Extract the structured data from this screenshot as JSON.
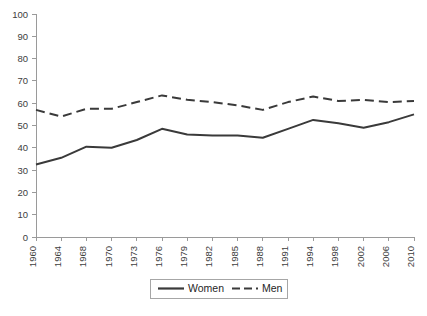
{
  "chart_data": {
    "type": "line",
    "title": "",
    "xlabel": "",
    "ylabel": "",
    "ylim": [
      0,
      100
    ],
    "ytick_step": 10,
    "yticks": [
      0,
      10,
      20,
      30,
      40,
      50,
      60,
      70,
      80,
      90,
      100
    ],
    "grid": false,
    "legend_position": "bottom-center",
    "categories": [
      "1960",
      "1964",
      "1968",
      "1970",
      "1973",
      "1976",
      "1979",
      "1982",
      "1985",
      "1988",
      "1991",
      "1994",
      "1998",
      "2002",
      "2006",
      "2010"
    ],
    "series": [
      {
        "name": "Women",
        "style": "solid",
        "color": "#3a3a3a",
        "values": [
          32.5,
          35.5,
          40.5,
          40.0,
          43.5,
          48.5,
          46.0,
          45.5,
          45.5,
          44.5,
          48.5,
          52.5,
          51.0,
          49.0,
          51.5,
          55.0
        ]
      },
      {
        "name": "Men",
        "style": "dashed",
        "color": "#3a3a3a",
        "values": [
          57.0,
          54.0,
          57.5,
          57.5,
          60.5,
          63.5,
          61.5,
          60.5,
          59.0,
          57.0,
          60.5,
          63.0,
          61.0,
          61.5,
          60.5,
          61.0
        ]
      }
    ]
  },
  "legend": {
    "items": [
      {
        "label": "Women",
        "style": "solid"
      },
      {
        "label": "Men",
        "style": "dashed"
      }
    ]
  },
  "axes": {
    "y_axis_name": "y-axis",
    "x_axis_name": "x-axis"
  }
}
